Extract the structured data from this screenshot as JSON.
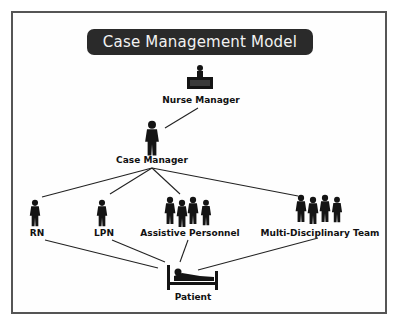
{
  "title": "Case Management Model",
  "nodes": {
    "nurse_manager": {
      "label": "Nurse Manager",
      "icon": "nurse-manager-at-desk-icon"
    },
    "case_manager": {
      "label": "Case Manager",
      "icon": "person-icon"
    },
    "rn": {
      "label": "RN",
      "icon": "person-icon"
    },
    "lpn": {
      "label": "LPN",
      "icon": "person-icon"
    },
    "assistive_personnel": {
      "label": "Assistive Personnel",
      "icon": "group-of-four-icon"
    },
    "multi_disciplinary_team": {
      "label": "Multi-Disciplinary Team",
      "icon": "group-of-four-icon"
    },
    "patient": {
      "label": "Patient",
      "icon": "patient-in-bed-icon"
    }
  },
  "edges": [
    [
      "nurse_manager",
      "case_manager"
    ],
    [
      "case_manager",
      "rn"
    ],
    [
      "case_manager",
      "lpn"
    ],
    [
      "case_manager",
      "assistive_personnel"
    ],
    [
      "case_manager",
      "multi_disciplinary_team"
    ],
    [
      "rn",
      "patient"
    ],
    [
      "lpn",
      "patient"
    ],
    [
      "assistive_personnel",
      "patient"
    ],
    [
      "multi_disciplinary_team",
      "patient"
    ]
  ],
  "colors": {
    "banner": "#2a2a2a",
    "ink": "#111111",
    "frame": "#555555"
  }
}
